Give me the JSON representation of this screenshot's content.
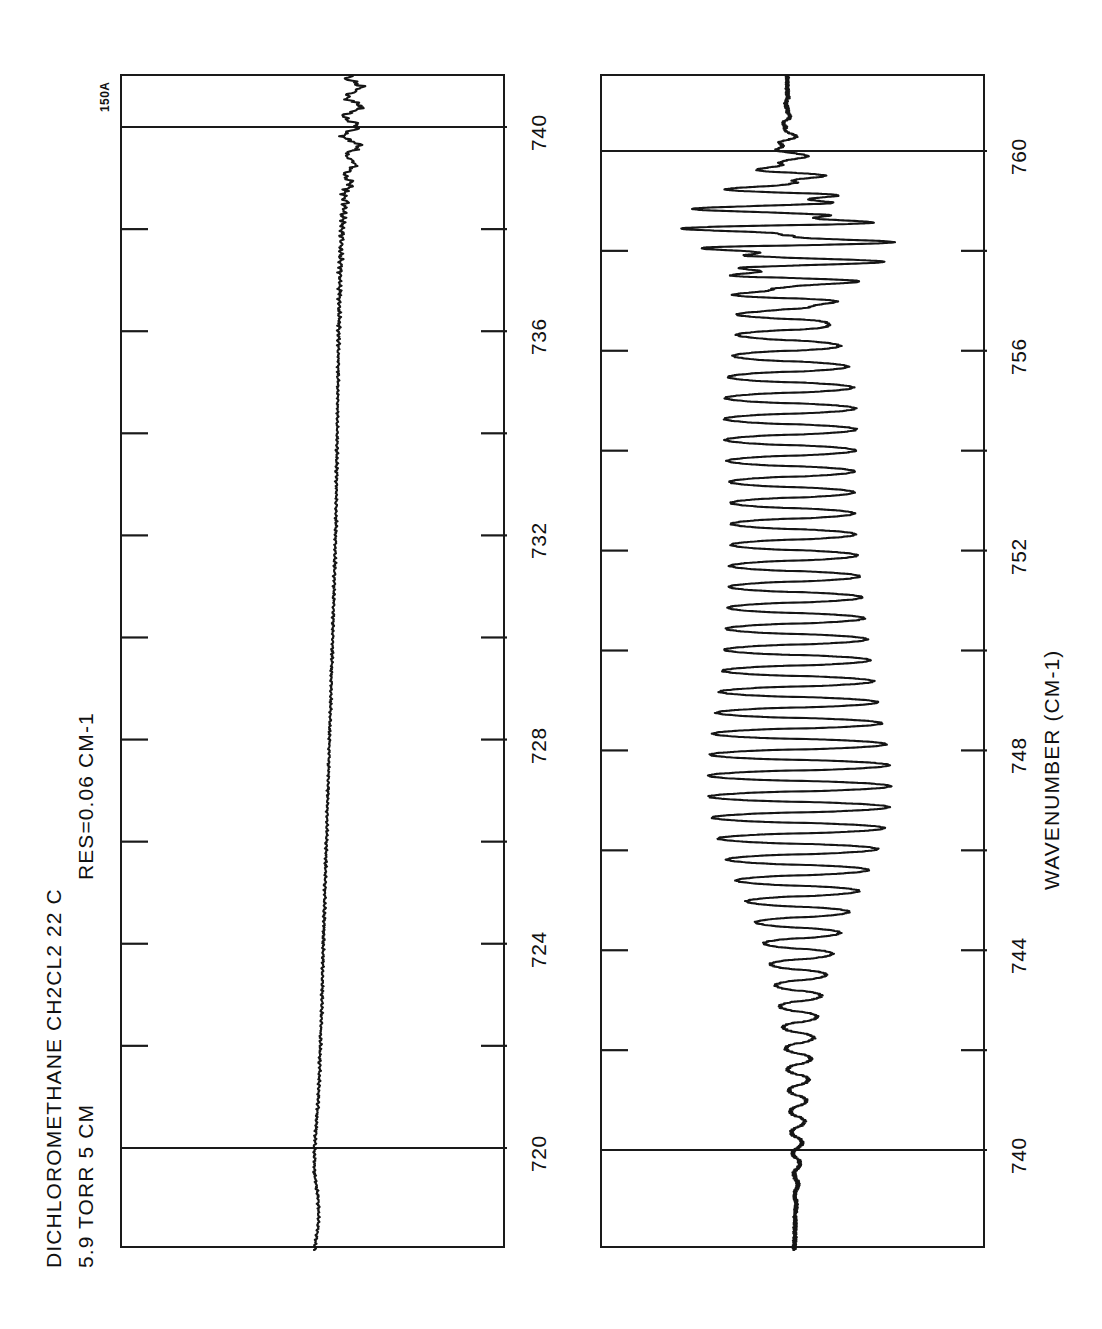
{
  "document": {
    "kind": "infrared-absorption-spectrum-chart",
    "corner_tag": "150A",
    "background_color": "#ffffff",
    "ink_color": "#151515"
  },
  "header": {
    "line1": "DICHLOROMETHANE  CH2CL2   22 C",
    "line2": "5.9 TORR  5 CM",
    "resolution": "RES=0.06 CM-1",
    "sample_name": "DICHLOROMETHANE",
    "formula": "CH2CL2",
    "temperature": "22 C",
    "pressure": "5.9 TORR",
    "pathlength": "5 CM"
  },
  "axis": {
    "title": "WAVENUMBER (CM-1)",
    "units": "CM-1",
    "minor_tick_interval": 2,
    "major_tick_interval": 4
  },
  "chart_data": {
    "type": "line",
    "title": "DICHLOROMETHANE  CH2CL2   22 C",
    "subtitle": "5.9 TORR  5 CM      RES=0.06 CM-1",
    "xlabel": "WAVENUMBER (CM-1)",
    "ylabel": "TRANSMITTANCE",
    "grid": true,
    "legend": "none",
    "orientation": "x-axis-vertical",
    "panels": [
      {
        "name": "panel-top",
        "xlim": [
          718.0,
          741.0
        ],
        "tick_labels": [
          720,
          724,
          728,
          732,
          736,
          740
        ],
        "minor_ticks": [
          722,
          726,
          730,
          734,
          738
        ],
        "major_gridlines": [
          720,
          740
        ],
        "description": "Flat, slightly drifting noisy baseline from 718 to 739 with weak absorption structure rising near 739-741",
        "baseline_level": 0.52,
        "x": [
          718.0,
          718.5,
          719.0,
          719.5,
          720.0,
          720.5,
          721.0,
          721.5,
          722.0,
          722.5,
          723.0,
          723.5,
          724.0,
          724.5,
          725.0,
          725.5,
          726.0,
          726.5,
          727.0,
          727.5,
          728.0,
          728.5,
          729.0,
          729.5,
          730.0,
          730.5,
          731.0,
          731.5,
          732.0,
          732.5,
          733.0,
          733.5,
          734.0,
          734.5,
          735.0,
          735.5,
          736.0,
          736.5,
          737.0,
          737.5,
          738.0,
          738.5,
          739.0,
          739.3,
          739.6,
          739.9,
          740.2,
          740.5,
          740.8,
          741.0
        ],
        "y": [
          0.5,
          0.51,
          0.51,
          0.5,
          0.5,
          0.505,
          0.51,
          0.513,
          0.515,
          0.518,
          0.52,
          0.521,
          0.523,
          0.525,
          0.527,
          0.529,
          0.531,
          0.533,
          0.535,
          0.537,
          0.539,
          0.541,
          0.543,
          0.545,
          0.547,
          0.549,
          0.551,
          0.553,
          0.555,
          0.556,
          0.557,
          0.558,
          0.559,
          0.56,
          0.561,
          0.562,
          0.563,
          0.564,
          0.566,
          0.568,
          0.571,
          0.577,
          0.588,
          0.596,
          0.6,
          0.592,
          0.598,
          0.601,
          0.603,
          0.604
        ]
      },
      {
        "name": "panel-bottom",
        "xlim": [
          738.0,
          761.5
        ],
        "tick_labels": [
          740,
          744,
          748,
          752,
          756,
          760
        ],
        "minor_ticks": [
          742,
          746,
          750,
          754,
          758
        ],
        "major_gridlines": [
          740,
          760
        ],
        "description": "Strong rotational band of the CH2Cl2 nu3 C-Cl region: regular oscillating Q-branch-like line structure growing from 740 to a maximum near 746-750, persisting through 756, then a very dense tight multiplet at 757.5-759.5, decaying after 760",
        "band_center": 758.5,
        "envelope_peaks": [
          746.8,
          750.5,
          752.5,
          755.0,
          757.0,
          758.3,
          758.9
        ],
        "oscillation_period_cm1": 0.42,
        "max_amplitude": 0.19,
        "baseline_level": 0.5
      }
    ]
  },
  "panel_labels": {
    "top": "panel-top",
    "bottom": "panel-bottom"
  }
}
